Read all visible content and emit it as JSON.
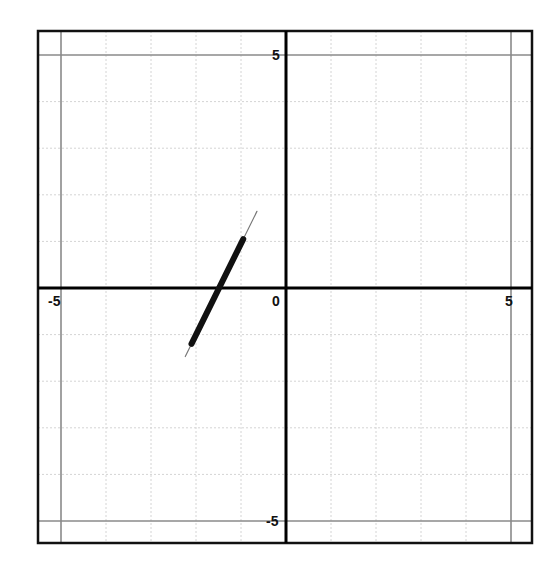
{
  "chart_data": {
    "type": "line",
    "title": "",
    "xlabel": "",
    "ylabel": "",
    "xlim": [
      -5.5,
      5.5
    ],
    "ylim": [
      -5.5,
      5.5
    ],
    "grid": true,
    "grid_step": 1,
    "legend": null,
    "tick_labels": {
      "x_neg": "-5",
      "x_zero": "0",
      "x_pos": "5",
      "y_pos": "5",
      "y_neg": "-5"
    },
    "series": [
      {
        "name": "segment",
        "style": "thick hand-drawn line",
        "points": [
          [
            -2.1,
            -1.2
          ],
          [
            -0.95,
            1.05
          ]
        ],
        "approx_line": "y = 2x + 3"
      }
    ],
    "colors": {
      "axis": "#000000",
      "frame": "#111111",
      "grid_minor": "#d4d4d4",
      "grid_major": "#8a8a8a",
      "series": "#111111"
    }
  }
}
